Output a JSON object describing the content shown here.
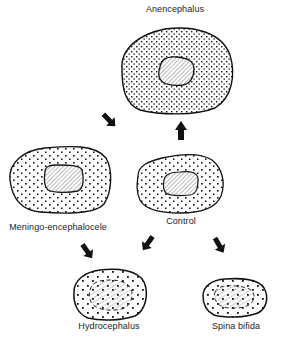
{
  "diagram": {
    "nodes": [
      {
        "id": "anencephalus",
        "label": "Anencephalus",
        "label_x": 175,
        "label_y": 11
      },
      {
        "id": "meningo",
        "label": "Meningo-encephalocele",
        "label_x": 58,
        "label_y": 224
      },
      {
        "id": "control",
        "label": "Control",
        "label_x": 181,
        "label_y": 218
      },
      {
        "id": "hydrocephalus",
        "label": "Hydrocephalus",
        "label_x": 109,
        "label_y": 321
      },
      {
        "id": "spina_bifida",
        "label": "Spina bifida",
        "label_x": 236,
        "label_y": 321
      }
    ],
    "arrows": [
      {
        "from": "control",
        "to": "anencephalus",
        "direction": "up"
      },
      {
        "from": "anencephalus",
        "to": "meningo",
        "direction": "down-left"
      },
      {
        "from": "meningo",
        "to": "hydrocephalus",
        "direction": "down-right"
      },
      {
        "from": "control",
        "to": "hydrocephalus",
        "direction": "down-left"
      },
      {
        "from": "control",
        "to": "spina_bifida",
        "direction": "down-right"
      }
    ],
    "colors": {
      "ink": "#111111",
      "background": "#ffffff",
      "hatch": "#555555"
    }
  }
}
